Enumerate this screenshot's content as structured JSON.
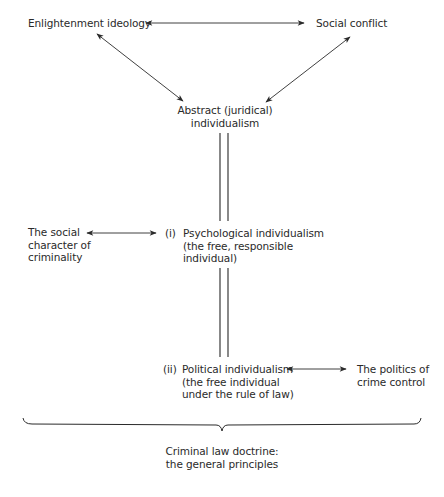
{
  "diagram": {
    "nodes": {
      "enlightenment": {
        "label": "Enlightenment ideology"
      },
      "social_conflict": {
        "label": "Social conflict"
      },
      "abstract": {
        "lines": [
          "Abstract (juridical)",
          "individualism"
        ]
      },
      "social_character": {
        "lines": [
          "The social",
          "character of",
          "criminality"
        ]
      },
      "psychological": {
        "marker": "(i)",
        "lines": [
          "Psychological individualism",
          "(the free, responsible",
          "individual)"
        ]
      },
      "political": {
        "marker": "(ii)",
        "lines": [
          "Political individualism",
          "(the free individual",
          "under the rule of law)"
        ]
      },
      "politics_crime": {
        "lines": [
          "The politics of",
          "crime control"
        ]
      },
      "doctrine": {
        "lines": [
          "Criminal law doctrine:",
          "the general principles"
        ]
      }
    },
    "edges": [
      {
        "from": "enlightenment",
        "to": "social_conflict",
        "type": "bidirectional-arrow"
      },
      {
        "from": "enlightenment",
        "to": "abstract",
        "type": "bidirectional-arrow"
      },
      {
        "from": "social_conflict",
        "to": "abstract",
        "type": "bidirectional-arrow"
      },
      {
        "from": "abstract",
        "to": "psychological",
        "type": "double-line"
      },
      {
        "from": "psychological",
        "to": "political",
        "type": "double-line"
      },
      {
        "from": "social_character",
        "to": "psychological",
        "type": "bidirectional-arrow"
      },
      {
        "from": "political",
        "to": "politics_crime",
        "type": "bidirectional-arrow"
      },
      {
        "from": "all",
        "to": "doctrine",
        "type": "brace"
      }
    ],
    "colors": {
      "ink": "#2a2a2a",
      "background": "#ffffff"
    }
  }
}
